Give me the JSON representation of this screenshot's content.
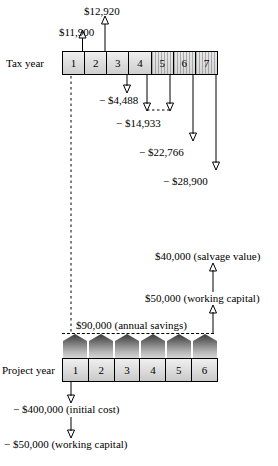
{
  "figure": {
    "tax_axis_label": "Tax year",
    "project_axis_label": "Project year",
    "tax_year_cells": [
      "1",
      "2",
      "3",
      "4",
      "5",
      "6",
      "7"
    ],
    "project_year_cells": [
      "1",
      "2",
      "3",
      "4",
      "5",
      "6"
    ]
  },
  "tax_flows": [
    {
      "id": "tax-1",
      "label": "$11,900",
      "sign": "inflow",
      "year": 1
    },
    {
      "id": "tax-2",
      "label": "$12,920",
      "sign": "inflow",
      "year": 2
    },
    {
      "id": "tax-3",
      "label": "− $4,488",
      "sign": "outflow",
      "year": 3
    },
    {
      "id": "tax-4",
      "label": "− $14,933",
      "sign": "outflow",
      "year": 5
    },
    {
      "id": "tax-5",
      "label": "− $22,766",
      "sign": "outflow",
      "year": 6
    },
    {
      "id": "tax-6",
      "label": "− $28,900",
      "sign": "outflow",
      "year": 7
    }
  ],
  "project_flows": [
    {
      "id": "pf-salvage",
      "label": "$40,000 (salvage value)",
      "sign": "inflow"
    },
    {
      "id": "pf-wc-in",
      "label": "$50,000 (working capital)",
      "sign": "inflow"
    },
    {
      "id": "pf-savings",
      "label": "$90,000 (annual savings)",
      "sign": "inflow"
    },
    {
      "id": "pf-initial",
      "label": "− $400,000 (initial cost)",
      "sign": "outflow"
    },
    {
      "id": "pf-wc-out",
      "label": "− $50,000 (working capital)",
      "sign": "outflow"
    }
  ],
  "colors": {
    "stroke": "#000000",
    "bar_fill": "#d9d9d9",
    "savings_fill": "#6d6d6d",
    "background": "#ffffff"
  }
}
